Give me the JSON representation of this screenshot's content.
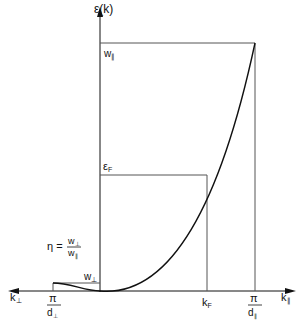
{
  "diagram": {
    "y_axis_label": "ε(k)",
    "x_axis_right_label": "k",
    "x_axis_right_sub": "∥",
    "x_axis_left_label": "k",
    "x_axis_left_sub": "⊥",
    "w_par_label": "w",
    "w_par_sub": "∥",
    "eps_f_label": "ε",
    "eps_f_sub": "F",
    "w_perp_label": "w",
    "w_perp_sub": "⊥",
    "kf_label": "k",
    "kf_sub": "F",
    "pi_label": "π",
    "d_par_label": "d",
    "d_par_sub": "∥",
    "d_perp_label": "d",
    "d_perp_sub": "⊥",
    "eta_label": "η =",
    "eta_num": "w",
    "eta_num_sub": "⊥",
    "eta_den": "w",
    "eta_den_sub": "∥"
  },
  "colors": {
    "axis": "#111111",
    "guide": "#555555",
    "curve": "#111111"
  }
}
